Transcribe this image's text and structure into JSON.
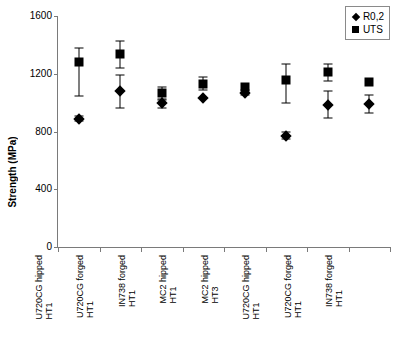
{
  "chart_data": {
    "type": "scatter",
    "title": "",
    "xlabel": "",
    "ylabel": "Strength (MPa)",
    "ylim": [
      0,
      1600
    ],
    "yticks": [
      0,
      400,
      800,
      1200,
      1600
    ],
    "ytick_labels": [
      "0",
      "400",
      "800",
      "1200",
      "1600"
    ],
    "grid": false,
    "legend_position": "top-right",
    "categories": [
      {
        "line1": "U720CG hipped",
        "line2": "HT1"
      },
      {
        "line1": "U720CG forged",
        "line2": "HT1"
      },
      {
        "line1": "IN738 forged",
        "line2": "HT1"
      },
      {
        "line1": "MC2 hipped",
        "line2": "HT1"
      },
      {
        "line1": "MC2 hipped",
        "line2": "HT3"
      },
      {
        "line1": "U720CG hipped",
        "line2": "HT1"
      },
      {
        "line1": "U720CG forged",
        "line2": "HT1"
      },
      {
        "line1": "IN738 forged",
        "line2": "HT1"
      }
    ],
    "series": [
      {
        "name": "R0,2",
        "marker": "diamond",
        "color": "#000000",
        "values": [
          890,
          1080,
          995,
          1030,
          1070,
          770,
          985,
          990
        ],
        "err_low": [
          875,
          965,
          965,
          1030,
          1055,
          745,
          895,
          925
        ],
        "err_high": [
          905,
          1190,
          1025,
          1030,
          1085,
          795,
          1080,
          1050
        ]
      },
      {
        "name": "UTS",
        "marker": "square",
        "color": "#000000",
        "values": [
          1280,
          1340,
          1065,
          1130,
          1105,
          1160,
          1215,
          1145
        ],
        "err_low": [
          1045,
          1240,
          1015,
          1085,
          1105,
          1000,
          1150,
          1145
        ],
        "err_high": [
          1375,
          1430,
          1110,
          1175,
          1105,
          1265,
          1270,
          1145
        ]
      }
    ]
  },
  "legend": {
    "entries": [
      {
        "label": "R0,2",
        "marker": "diamond"
      },
      {
        "label": "UTS",
        "marker": "square"
      }
    ]
  }
}
